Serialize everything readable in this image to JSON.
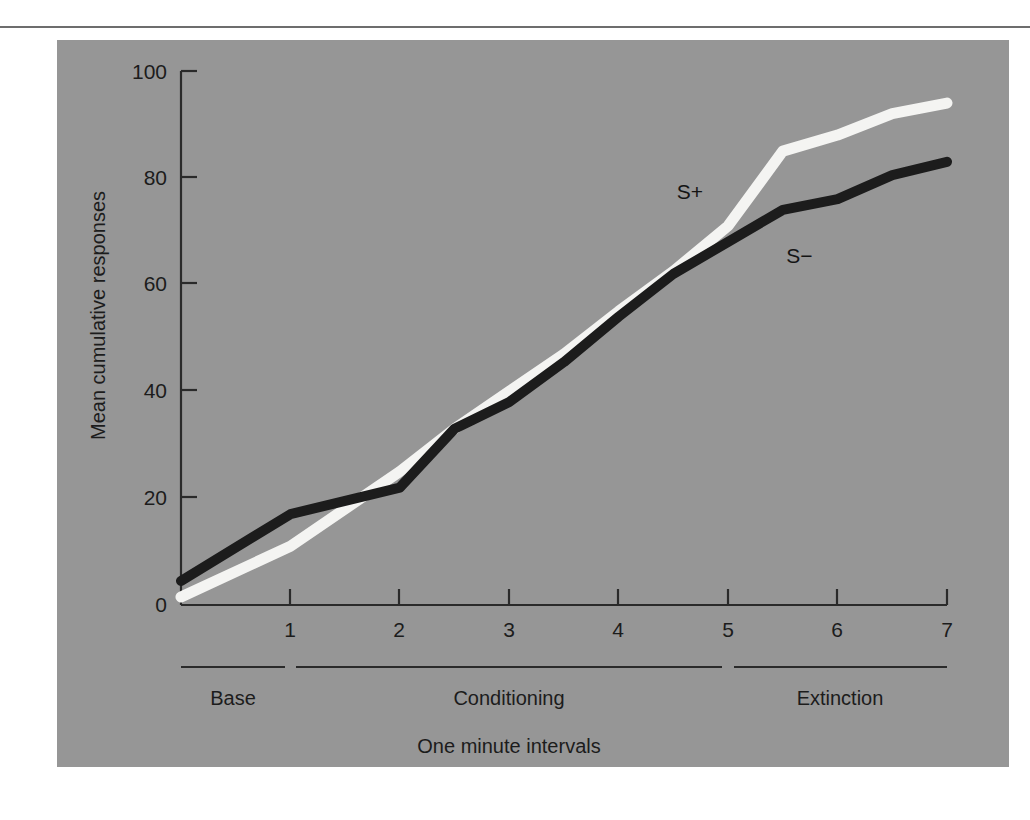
{
  "figure": {
    "background_color": "#969696",
    "page_color": "#ffffff",
    "rule_color": "#6d6d6d"
  },
  "chart_data": {
    "type": "line",
    "title": "",
    "xlabel": "One minute intervals",
    "ylabel": "Mean cumulative responses",
    "xlim": [
      0,
      7
    ],
    "ylim": [
      0,
      100
    ],
    "grid": false,
    "legend_position": "inline-annotation",
    "x_ticks": [
      "1",
      "2",
      "3",
      "4",
      "5",
      "6",
      "7"
    ],
    "x_tick_values": [
      1,
      2,
      3,
      4,
      5,
      6,
      7
    ],
    "y_ticks": [
      "0",
      "20",
      "40",
      "60",
      "80",
      "100"
    ],
    "y_tick_values": [
      0,
      20,
      40,
      60,
      80,
      100
    ],
    "series": [
      {
        "name": "S+",
        "label": "S+",
        "color": "#f4f4f2",
        "stroke_width": 11,
        "x": [
          0,
          1,
          2,
          2.5,
          3,
          3.5,
          4,
          4.5,
          5,
          5.5,
          6,
          6.5,
          7
        ],
        "values": [
          1.5,
          11,
          25,
          33,
          40,
          47,
          55,
          62.5,
          71,
          85,
          88,
          92,
          94
        ]
      },
      {
        "name": "S-",
        "label": "S−",
        "color": "#1c1c1c",
        "stroke_width": 10,
        "x": [
          0,
          1,
          2,
          2.5,
          3,
          3.5,
          4,
          4.5,
          5,
          5.5,
          6,
          6.5,
          7
        ],
        "values": [
          4.5,
          17,
          22,
          33,
          38,
          45.5,
          54,
          62,
          68,
          74,
          76,
          80.5,
          83
        ]
      }
    ],
    "annotations": [
      {
        "text": "S+",
        "x": 4.65,
        "y": 76
      },
      {
        "text": "S−",
        "x": 5.65,
        "y": 64
      }
    ],
    "phases": [
      {
        "label": "Base",
        "x_start": 0,
        "x_end": 1
      },
      {
        "label": "Conditioning",
        "x_start": 1,
        "x_end": 5
      },
      {
        "label": "Extinction",
        "x_start": 5,
        "x_end": 7
      }
    ]
  }
}
